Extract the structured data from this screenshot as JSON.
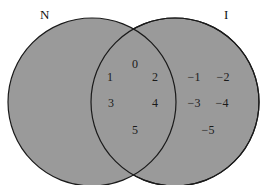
{
  "diagram": {
    "type": "venn",
    "fill_color": "#9a9a9a",
    "stroke_color": "#1a1a1a",
    "sets": [
      {
        "label": "N",
        "elements_only": [
          "1",
          "3"
        ]
      },
      {
        "label": "I",
        "elements_only": [
          "−1",
          "−2",
          "−3",
          "−4",
          "−5"
        ]
      }
    ],
    "intersection": [
      "0",
      "2",
      "4",
      "5"
    ],
    "labels": {
      "left": "N",
      "right": "I"
    },
    "numbers": {
      "n0": "0",
      "n1": "1",
      "n2": "2",
      "n3": "3",
      "n4": "4",
      "n5": "5",
      "m1": "−1",
      "m2": "−2",
      "m3": "−3",
      "m4": "−4",
      "m5": "−5"
    }
  }
}
